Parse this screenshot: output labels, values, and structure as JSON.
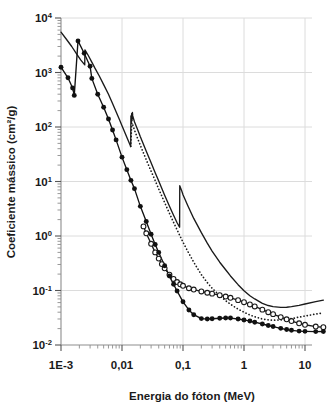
{
  "chart_data": {
    "type": "line",
    "title": "",
    "xlabel": "Energia do fóton (MeV)",
    "ylabel": "Coeficiente mássico (cm²/g)",
    "xscale": "log",
    "yscale": "log",
    "xlim": [
      0.001,
      20
    ],
    "ylim": [
      0.01,
      10000
    ],
    "grid": true,
    "legend": "none",
    "xticks": [
      {
        "value": 0.001,
        "label": "1E-3"
      },
      {
        "value": 0.01,
        "label": "0,01"
      },
      {
        "value": 0.1,
        "label": "0,1"
      },
      {
        "value": 1,
        "label": "1"
      },
      {
        "value": 10,
        "label": "10"
      }
    ],
    "yticks": [
      {
        "value": 10000,
        "mantissa": "10",
        "exponent": "4"
      },
      {
        "value": 1000,
        "mantissa": "10",
        "exponent": "3"
      },
      {
        "value": 100,
        "mantissa": "10",
        "exponent": "2"
      },
      {
        "value": 10,
        "mantissa": "10",
        "exponent": "1"
      },
      {
        "value": 1,
        "mantissa": "10",
        "exponent": "0"
      },
      {
        "value": 0.1,
        "mantissa": "10",
        "exponent": "-1"
      },
      {
        "value": 0.01,
        "mantissa": "10",
        "exponent": "-2"
      }
    ],
    "series": [
      {
        "name": "solid-line-upper",
        "style": "solid",
        "marker": "none",
        "color": "#1a1a1a",
        "points": [
          [
            0.001,
            5500
          ],
          [
            0.0012,
            4200
          ],
          [
            0.0015,
            3000
          ],
          [
            0.0018,
            2200
          ],
          [
            0.0021,
            1700
          ],
          [
            0.00245,
            1380
          ],
          [
            0.00247,
            2600
          ],
          [
            0.0028,
            2050
          ],
          [
            0.0032,
            1550
          ],
          [
            0.0036,
            1200
          ],
          [
            0.0042,
            880
          ],
          [
            0.005,
            600
          ],
          [
            0.006,
            400
          ],
          [
            0.007,
            270
          ],
          [
            0.008,
            190
          ],
          [
            0.009,
            140
          ],
          [
            0.01,
            105
          ],
          [
            0.012,
            65
          ],
          [
            0.0139,
            44
          ],
          [
            0.014,
            160
          ],
          [
            0.0142,
            120
          ],
          [
            0.0144,
            175
          ],
          [
            0.0146,
            130
          ],
          [
            0.0148,
            185
          ],
          [
            0.015,
            160
          ],
          [
            0.016,
            125
          ],
          [
            0.018,
            90
          ],
          [
            0.02,
            66
          ],
          [
            0.025,
            36
          ],
          [
            0.03,
            22
          ],
          [
            0.035,
            14.5
          ],
          [
            0.04,
            10.2
          ],
          [
            0.05,
            5.6
          ],
          [
            0.06,
            3.5
          ],
          [
            0.07,
            2.4
          ],
          [
            0.08,
            1.75
          ],
          [
            0.088,
            1.45
          ],
          [
            0.0885,
            8.4
          ],
          [
            0.095,
            6.8
          ],
          [
            0.1,
            5.7
          ],
          [
            0.12,
            3.6
          ],
          [
            0.15,
            2.1
          ],
          [
            0.2,
            1.15
          ],
          [
            0.25,
            0.74
          ],
          [
            0.3,
            0.53
          ],
          [
            0.4,
            0.33
          ],
          [
            0.5,
            0.24
          ],
          [
            0.6,
            0.185
          ],
          [
            0.8,
            0.128
          ],
          [
            1.0,
            0.099
          ],
          [
            1.25,
            0.08
          ],
          [
            1.5,
            0.07
          ],
          [
            2.0,
            0.058
          ],
          [
            2.5,
            0.053
          ],
          [
            3.0,
            0.0505
          ],
          [
            4.0,
            0.049
          ],
          [
            5.0,
            0.0493
          ],
          [
            6.0,
            0.0505
          ],
          [
            8.0,
            0.0535
          ],
          [
            10,
            0.0565
          ],
          [
            15,
            0.0625
          ],
          [
            20,
            0.0665
          ]
        ]
      },
      {
        "name": "dotted-line",
        "style": "dotted",
        "marker": "none",
        "color": "#1a1a1a",
        "points": [
          [
            0.0139,
            44
          ],
          [
            0.0145,
            120
          ],
          [
            0.015,
            110
          ],
          [
            0.016,
            88
          ],
          [
            0.018,
            62
          ],
          [
            0.02,
            46
          ],
          [
            0.025,
            25
          ],
          [
            0.03,
            15.5
          ],
          [
            0.035,
            10.4
          ],
          [
            0.04,
            7.3
          ],
          [
            0.05,
            4.1
          ],
          [
            0.06,
            2.6
          ],
          [
            0.07,
            1.78
          ],
          [
            0.08,
            1.3
          ],
          [
            0.09,
            0.98
          ],
          [
            0.1,
            0.77
          ],
          [
            0.12,
            0.52
          ],
          [
            0.15,
            0.33
          ],
          [
            0.2,
            0.195
          ],
          [
            0.25,
            0.14
          ],
          [
            0.3,
            0.11
          ],
          [
            0.4,
            0.08
          ],
          [
            0.5,
            0.065
          ],
          [
            0.6,
            0.056
          ],
          [
            0.8,
            0.0455
          ],
          [
            1.0,
            0.04
          ],
          [
            1.25,
            0.0355
          ],
          [
            1.5,
            0.033
          ],
          [
            2.0,
            0.03
          ],
          [
            2.5,
            0.029
          ],
          [
            3.0,
            0.0285
          ],
          [
            4.0,
            0.0288
          ],
          [
            5.0,
            0.0295
          ],
          [
            6.0,
            0.0305
          ],
          [
            8.0,
            0.0325
          ],
          [
            10,
            0.034
          ],
          [
            15,
            0.037
          ],
          [
            20,
            0.039
          ]
        ]
      },
      {
        "name": "open-circles",
        "style": "solid",
        "marker": "open-circle",
        "color": "#1a1a1a",
        "points": [
          [
            0.0225,
            1.5
          ],
          [
            0.025,
            1.12
          ],
          [
            0.03,
            0.72
          ],
          [
            0.035,
            0.5
          ],
          [
            0.04,
            0.385
          ],
          [
            0.045,
            0.305
          ],
          [
            0.05,
            0.255
          ],
          [
            0.06,
            0.195
          ],
          [
            0.07,
            0.163
          ],
          [
            0.08,
            0.143
          ],
          [
            0.09,
            0.13
          ],
          [
            0.1,
            0.122
          ],
          [
            0.125,
            0.11
          ],
          [
            0.15,
            0.104
          ],
          [
            0.2,
            0.096
          ],
          [
            0.25,
            0.091
          ],
          [
            0.3,
            0.0875
          ],
          [
            0.4,
            0.082
          ],
          [
            0.5,
            0.0775
          ],
          [
            0.6,
            0.0735
          ],
          [
            0.8,
            0.0665
          ],
          [
            1.0,
            0.061
          ],
          [
            1.25,
            0.0555
          ],
          [
            1.5,
            0.051
          ],
          [
            2.0,
            0.0445
          ],
          [
            2.5,
            0.04
          ],
          [
            3.0,
            0.0368
          ],
          [
            4.0,
            0.0325
          ],
          [
            5.0,
            0.0296
          ],
          [
            6.0,
            0.0275
          ],
          [
            8.0,
            0.025
          ],
          [
            10,
            0.0235
          ],
          [
            15,
            0.0218
          ],
          [
            20,
            0.0212
          ]
        ]
      },
      {
        "name": "filled-circles",
        "style": "solid",
        "marker": "filled-circle",
        "color": "#111111",
        "points": [
          [
            0.001,
            1250
          ],
          [
            0.0013,
            800
          ],
          [
            0.00155,
            520
          ],
          [
            0.00165,
            380
          ],
          [
            0.0019,
            3800
          ],
          [
            0.0024,
            2250
          ],
          [
            0.003,
            1300
          ],
          [
            0.0032,
            780
          ],
          [
            0.004,
            400
          ],
          [
            0.005,
            230
          ],
          [
            0.006,
            140
          ],
          [
            0.007,
            88
          ],
          [
            0.008,
            58
          ],
          [
            0.01,
            28
          ],
          [
            0.012,
            16.5
          ],
          [
            0.014,
            10.5
          ],
          [
            0.016,
            7.4
          ],
          [
            0.02,
            3.5
          ],
          [
            0.025,
            1.85
          ],
          [
            0.03,
            1.08
          ],
          [
            0.035,
            0.7
          ],
          [
            0.04,
            0.5
          ],
          [
            0.05,
            0.285
          ],
          [
            0.06,
            0.185
          ],
          [
            0.07,
            0.13
          ],
          [
            0.08,
            0.098
          ],
          [
            0.1,
            0.062
          ],
          [
            0.125,
            0.044
          ],
          [
            0.15,
            0.036
          ],
          [
            0.2,
            0.0305
          ],
          [
            0.25,
            0.03
          ],
          [
            0.3,
            0.0303
          ],
          [
            0.4,
            0.031
          ],
          [
            0.5,
            0.0313
          ],
          [
            0.6,
            0.0312
          ],
          [
            0.8,
            0.03
          ],
          [
            1.0,
            0.0288
          ],
          [
            1.25,
            0.0275
          ],
          [
            1.5,
            0.0262
          ],
          [
            2.0,
            0.0243
          ],
          [
            2.5,
            0.0228
          ],
          [
            3.0,
            0.0218
          ],
          [
            4.0,
            0.0202
          ],
          [
            5.0,
            0.0192
          ],
          [
            6.0,
            0.0186
          ],
          [
            8.0,
            0.018
          ],
          [
            10.0,
            0.0178
          ],
          [
            15.0,
            0.0176
          ],
          [
            20.0,
            0.0177
          ]
        ]
      }
    ]
  }
}
